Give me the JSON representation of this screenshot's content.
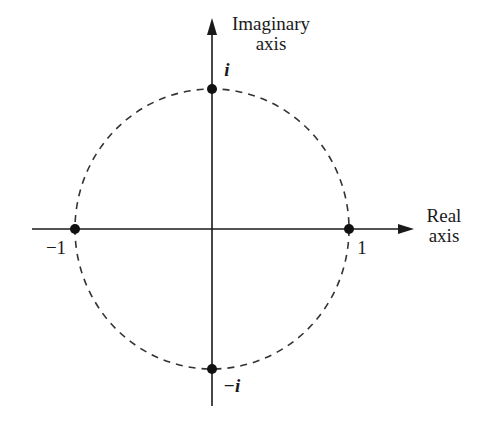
{
  "diagram": {
    "axes": {
      "imaginary": {
        "label_line1": "Imaginary",
        "label_line2": "axis"
      },
      "real": {
        "label_line1": "Real",
        "label_line2": "axis"
      }
    },
    "points": [
      {
        "name": "i",
        "label": "i"
      },
      {
        "name": "minus-i",
        "label": "−i"
      },
      {
        "name": "one",
        "label": "1"
      },
      {
        "name": "minus-one",
        "label": "−1"
      }
    ],
    "circle": {
      "style": "dashed",
      "radius": 1
    },
    "colors": {
      "ink": "#1a1a1a",
      "background": "#ffffff"
    }
  }
}
